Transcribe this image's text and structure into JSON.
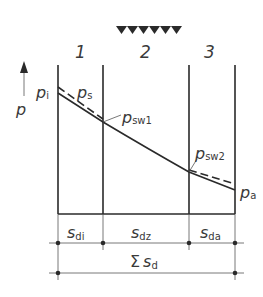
{
  "diagram": {
    "zones": [
      {
        "label": "1"
      },
      {
        "label": "2"
      },
      {
        "label": "3"
      }
    ],
    "axis_label": "p",
    "curve_labels": {
      "p_i": {
        "base": "p",
        "sub": "i"
      },
      "p_s": {
        "base": "p",
        "sub": "s"
      },
      "p_sw1": {
        "base": "p",
        "sub": "sw1"
      },
      "p_sw2": {
        "base": "p",
        "sub": "sw2"
      },
      "p_a": {
        "base": "p",
        "sub": "a"
      }
    },
    "dimensions": [
      {
        "base": "s",
        "sub": "di"
      },
      {
        "base": "s",
        "sub": "dz"
      },
      {
        "base": "s",
        "sub": "da"
      }
    ],
    "total_dimension": {
      "prefix": "Σ",
      "base": "s",
      "sub": "d"
    },
    "heating_marks_count": 6
  }
}
